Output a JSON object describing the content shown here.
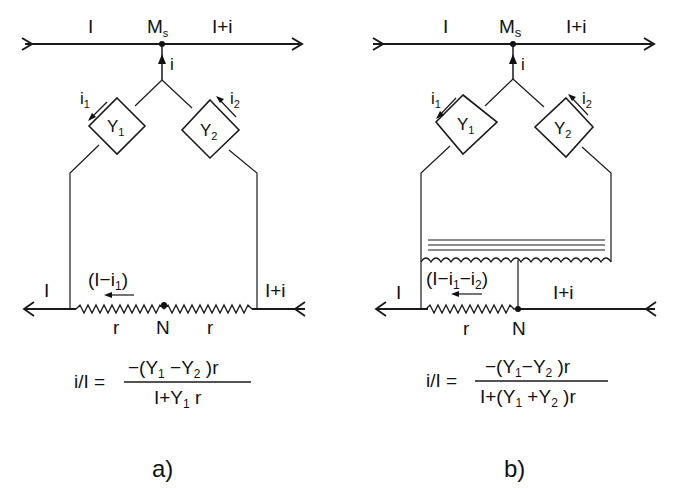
{
  "diagrams": [
    {
      "id": "a",
      "caption": "a)",
      "top_line": {
        "left_label": "I",
        "node_label": "M",
        "node_sub": "s",
        "right_label": "I+i"
      },
      "branch_current": "i",
      "admittances": [
        {
          "label": "Y",
          "sub": "1",
          "current": "i",
          "current_sub": "1"
        },
        {
          "label": "Y",
          "sub": "2",
          "current": "i",
          "current_sub": "2"
        }
      ],
      "bottom_line": {
        "left_label": "I",
        "right_label": "I+i",
        "loop_current": "(I−i",
        "loop_current_sub": "1",
        "loop_current_close": ")",
        "resistor_left": "r",
        "node_label": "N",
        "resistor_right": "r"
      },
      "formula": {
        "lhs": "i/I =",
        "numerator": "−(Y",
        "num_sub1": "1",
        "num_mid": " −Y",
        "num_sub2": "2",
        "num_end": " )r",
        "denominator": "I+Y",
        "den_sub": "1",
        "den_end": " r"
      }
    },
    {
      "id": "b",
      "caption": "b)",
      "top_line": {
        "left_label": "I",
        "node_label": "M",
        "node_sub": "s",
        "right_label": "I+i"
      },
      "branch_current": "i",
      "admittances": [
        {
          "label": "Y",
          "sub": "1",
          "current": "i",
          "current_sub": "1"
        },
        {
          "label": "Y",
          "sub": "2",
          "current": "i",
          "current_sub": "2"
        }
      ],
      "bottom_line": {
        "left_label": "I",
        "right_label": "I+i",
        "loop_current": "(I−i",
        "loop_current_sub1": "1",
        "loop_current_mid": "−i",
        "loop_current_sub2": "2",
        "loop_current_close": ")",
        "resistor_left": "r",
        "node_label": "N"
      },
      "formula": {
        "lhs": "i/I =",
        "numerator": "−(Y",
        "num_sub1": "1",
        "num_mid": "−Y",
        "num_sub2": "2",
        "num_end": " )r",
        "denominator": "I+(Y",
        "den_sub1": "1",
        "den_mid": " +Y",
        "den_sub2": "2",
        "den_end": " )r"
      }
    }
  ]
}
